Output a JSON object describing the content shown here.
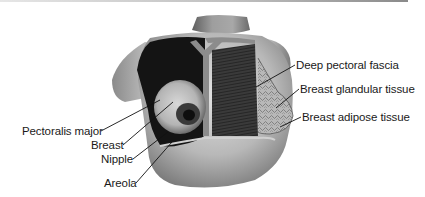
{
  "figure": {
    "colors": {
      "skin_light": "#d9d9d9",
      "skin_mid": "#a8a8a8",
      "skin_dark": "#6e6e6e",
      "muscle_dark": "#151515",
      "fascia": "#8f8f8f",
      "glandular": "#bdbdbd",
      "label_text": "#1a1a1a",
      "leader_line": "#111111"
    },
    "labels_left": [
      {
        "text": "Pectoralis major",
        "x": 22,
        "y": 125
      },
      {
        "text": "Breast",
        "x": 91,
        "y": 139
      },
      {
        "text": "Nipple",
        "x": 101,
        "y": 153
      },
      {
        "text": "Areola",
        "x": 104,
        "y": 177
      }
    ],
    "labels_right": [
      {
        "text": "Deep pectoral fascia",
        "x": 296,
        "y": 59
      },
      {
        "text": "Breast glandular tissue",
        "x": 300,
        "y": 83
      },
      {
        "text": "Breast adipose tissue",
        "x": 302,
        "y": 111
      }
    ]
  }
}
